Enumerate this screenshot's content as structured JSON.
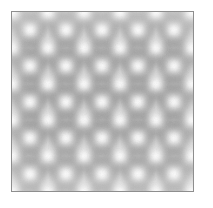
{
  "canvas": {
    "width": 213,
    "height": 208,
    "background_color": "#ffffff"
  },
  "swatch": {
    "label": "seamless grayscale texture swatch",
    "x": 11,
    "y": 11,
    "width": 183,
    "height": 181,
    "border_color": "#8e8e8e",
    "border_width": 1,
    "base_color": "#d9d9d9"
  },
  "texture": {
    "name": "tiling-gray-organic-lattice",
    "type": "seamless-repeating-pattern",
    "tile_period_x": 36,
    "tile_period_y": 36,
    "tiles_across": 5,
    "tiles_down": 5,
    "lattice": "square-with-offset-centers",
    "blur_radius": 3.2,
    "palette": {
      "base": "#d8d8d8",
      "highlight": "#ffffff",
      "light": "#ececec",
      "mid": "#c2c2c2",
      "shadow": "#a3a3a3",
      "deep_shadow": "#8f8f8f"
    },
    "motif": {
      "description": "bright round highlight node ringed by four darker lobes, repeating on a square lattice with half-period offset nodes between",
      "node_radius": 3.2,
      "lobe_radius": 7.0,
      "ring_radius": 11.0
    },
    "grain": {
      "enabled": true,
      "opacity": 0.22,
      "scale": 0.85
    }
  }
}
